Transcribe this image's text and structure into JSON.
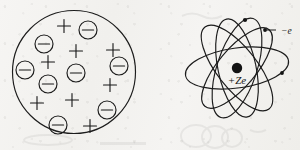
{
  "figure": {
    "width": 300,
    "height": 150,
    "background_color": "#f4f3f1",
    "ink_color": "#1b1b1b",
    "style": "hand-drawn scanned line art, no caption text"
  },
  "left_diagram": {
    "name": "Thomson plum-pudding model",
    "outline": {
      "shape": "circle",
      "cx": 74,
      "cy": 72,
      "r": 61.5,
      "stroke_width": 1.15
    },
    "positive_charge_glyph": "+",
    "negative_charge_glyph": "⊖",
    "positive_count": 8,
    "negative_count": 9,
    "positive_charges": [
      {
        "cx": 64,
        "cy": 26,
        "size": 13
      },
      {
        "cx": 76,
        "cy": 51,
        "size": 13
      },
      {
        "cx": 113,
        "cy": 50,
        "size": 13
      },
      {
        "cx": 48,
        "cy": 62,
        "size": 13
      },
      {
        "cx": 110,
        "cy": 85,
        "size": 13
      },
      {
        "cx": 37,
        "cy": 103,
        "size": 13
      },
      {
        "cx": 72,
        "cy": 100,
        "size": 13
      },
      {
        "cx": 90,
        "cy": 126,
        "size": 13
      }
    ],
    "negative_charges": [
      {
        "cx": 88,
        "cy": 30,
        "r": 9.0
      },
      {
        "cx": 44,
        "cy": 44,
        "r": 9.0
      },
      {
        "cx": 25,
        "cy": 70,
        "r": 9.0
      },
      {
        "cx": 119,
        "cy": 66,
        "r": 9.0
      },
      {
        "cx": 76,
        "cy": 73,
        "r": 9.0
      },
      {
        "cx": 48,
        "cy": 84,
        "r": 9.0
      },
      {
        "cx": 107,
        "cy": 110,
        "r": 9.0
      },
      {
        "cx": 58,
        "cy": 125,
        "r": 9.0
      }
    ]
  },
  "right_diagram": {
    "name": "Rutherford-Bohr planetary model",
    "center": {
      "cx": 237,
      "cy": 68
    },
    "nucleus": {
      "cx": 237,
      "cy": 68,
      "r": 5.2,
      "fill": "#131313"
    },
    "nucleus_label": "+Ze",
    "nucleus_label_pos": {
      "x": 237,
      "y": 84
    },
    "electron_label": "−e",
    "electron_label_pos": {
      "x": 283,
      "y": 31
    },
    "leader_line": {
      "from_x": 276,
      "from_y": 30,
      "to_x": 265,
      "to_y": 30
    },
    "orbit_count": 5,
    "orbits": [
      {
        "rx": 52,
        "ry": 20,
        "rotation": -8
      },
      {
        "rx": 52,
        "ry": 20,
        "rotation": 52
      },
      {
        "rx": 52,
        "ry": 20,
        "rotation": 108
      },
      {
        "rx": 50,
        "ry": 19,
        "rotation": 78
      },
      {
        "rx": 50,
        "ry": 19,
        "rotation": 130
      }
    ],
    "electrons": [
      {
        "cx": 245,
        "cy": 20,
        "r": 2.1
      },
      {
        "cx": 265,
        "cy": 30,
        "r": 1.9
      },
      {
        "cx": 282,
        "cy": 73,
        "r": 1.9
      }
    ],
    "stroke_width": 1.15
  },
  "ghost_marks": {
    "description": "faint show-through ink from the reverse of the scanned page",
    "opacity": 0.085
  }
}
